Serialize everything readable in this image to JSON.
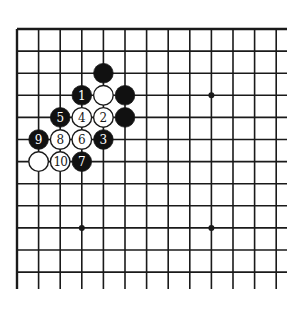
{
  "diagram": {
    "type": "go-board-diagram",
    "board_fragment": {
      "columns": 13,
      "rows": 12,
      "edges": {
        "top": true,
        "left": true,
        "right": false,
        "bottom": false
      }
    },
    "colors": {
      "line": "#1a1a1a",
      "black_stone": "#111111",
      "white_stone": "#ffffff",
      "black_label": "#ffffff",
      "white_label": "#1a1a1a",
      "background": "#ffffff"
    },
    "star_points": [
      {
        "col": 9,
        "row": 3
      },
      {
        "col": 3,
        "row": 9
      },
      {
        "col": 9,
        "row": 9
      }
    ],
    "stones": [
      {
        "color": "black",
        "col": 4,
        "row": 2,
        "label": ""
      },
      {
        "color": "black",
        "col": 3,
        "row": 3,
        "label": "1"
      },
      {
        "color": "white",
        "col": 4,
        "row": 3,
        "label": ""
      },
      {
        "color": "black",
        "col": 5,
        "row": 3,
        "label": ""
      },
      {
        "color": "black",
        "col": 2,
        "row": 4,
        "label": "5"
      },
      {
        "color": "white",
        "col": 3,
        "row": 4,
        "label": "4"
      },
      {
        "color": "white",
        "col": 4,
        "row": 4,
        "label": "2"
      },
      {
        "color": "black",
        "col": 5,
        "row": 4,
        "label": ""
      },
      {
        "color": "black",
        "col": 1,
        "row": 5,
        "label": "9"
      },
      {
        "color": "white",
        "col": 2,
        "row": 5,
        "label": "8"
      },
      {
        "color": "white",
        "col": 3,
        "row": 5,
        "label": "6"
      },
      {
        "color": "black",
        "col": 4,
        "row": 5,
        "label": "3"
      },
      {
        "color": "white",
        "col": 1,
        "row": 6,
        "label": ""
      },
      {
        "color": "white",
        "col": 2,
        "row": 6,
        "label": "10"
      },
      {
        "color": "black",
        "col": 3,
        "row": 6,
        "label": "7"
      }
    ]
  }
}
